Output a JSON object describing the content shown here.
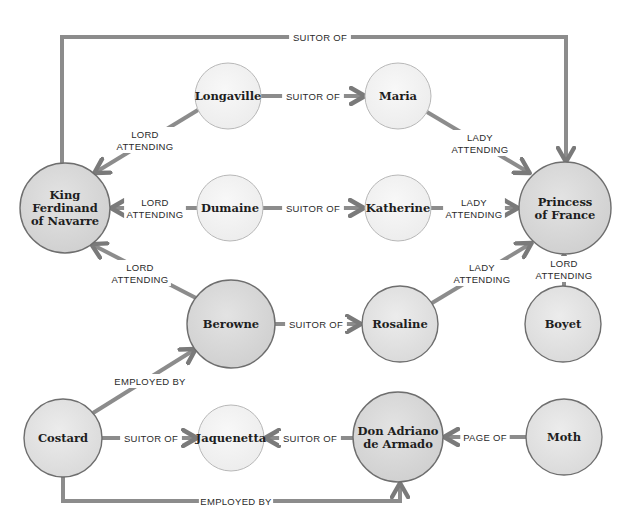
{
  "diagram": {
    "type": "character relationship graph",
    "nodes": [
      {
        "id": "king",
        "label_lines": [
          "King",
          "Ferdinand",
          "of Navarre"
        ],
        "cx": 65,
        "cy": 208,
        "r": 45,
        "shade": "dark"
      },
      {
        "id": "longaville",
        "label_lines": [
          "Longaville"
        ],
        "cx": 228,
        "cy": 96,
        "r": 33,
        "shade": "light"
      },
      {
        "id": "maria",
        "label_lines": [
          "Maria"
        ],
        "cx": 398,
        "cy": 96,
        "r": 33,
        "shade": "light"
      },
      {
        "id": "dumaine",
        "label_lines": [
          "Dumaine"
        ],
        "cx": 230,
        "cy": 208,
        "r": 33,
        "shade": "light"
      },
      {
        "id": "katherine",
        "label_lines": [
          "Katherine"
        ],
        "cx": 398,
        "cy": 208,
        "r": 33,
        "shade": "light"
      },
      {
        "id": "princess",
        "label_lines": [
          "Princess",
          "of France"
        ],
        "cx": 565,
        "cy": 208,
        "r": 46,
        "shade": "dark"
      },
      {
        "id": "berowne",
        "label_lines": [
          "Berowne"
        ],
        "cx": 231,
        "cy": 324,
        "r": 44,
        "shade": "dark"
      },
      {
        "id": "rosaline",
        "label_lines": [
          "Rosaline"
        ],
        "cx": 400,
        "cy": 324,
        "r": 38,
        "shade": "mid"
      },
      {
        "id": "boyet",
        "label_lines": [
          "Boyet"
        ],
        "cx": 563,
        "cy": 324,
        "r": 38,
        "shade": "mid"
      },
      {
        "id": "costard",
        "label_lines": [
          "Costard"
        ],
        "cx": 63,
        "cy": 438,
        "r": 39,
        "shade": "mid"
      },
      {
        "id": "jaquenetta",
        "label_lines": [
          "Jaquenetta"
        ],
        "cx": 231,
        "cy": 438,
        "r": 33,
        "shade": "light"
      },
      {
        "id": "armado",
        "label_lines": [
          "Don Adriano",
          "de Armado"
        ],
        "cx": 398,
        "cy": 437,
        "r": 45,
        "shade": "dark"
      },
      {
        "id": "moth",
        "label_lines": [
          "Moth"
        ],
        "cx": 564,
        "cy": 437,
        "r": 38,
        "shade": "mid"
      }
    ],
    "edges": [
      {
        "from": "king",
        "to": "princess",
        "label_lines": [
          "SUITOR OF"
        ],
        "path": "M62,163 L62,37 L566,37 L566,160",
        "label_x": 320,
        "label_y": 37
      },
      {
        "from": "longaville",
        "to": "maria",
        "label_lines": [
          "SUITOR OF"
        ],
        "path": "M261,96 L363,96",
        "label_x": 313,
        "label_y": 96
      },
      {
        "from": "longaville",
        "to": "king",
        "label_lines": [
          "LORD",
          "ATTENDING"
        ],
        "path": "M198,110 L96,172",
        "label_x": 145,
        "label_y": 140
      },
      {
        "from": "maria",
        "to": "princess",
        "label_lines": [
          "LADY",
          "ATTENDING"
        ],
        "path": "M427,112 L528,172",
        "label_x": 480,
        "label_y": 143
      },
      {
        "from": "dumaine",
        "to": "king",
        "label_lines": [
          "LORD",
          "ATTENDING"
        ],
        "path": "M197,208 L113,208",
        "label_x": 155,
        "label_y": 208
      },
      {
        "from": "dumaine",
        "to": "katherine",
        "label_lines": [
          "SUITOR OF"
        ],
        "path": "M263,208 L362,208",
        "label_x": 313,
        "label_y": 208
      },
      {
        "from": "katherine",
        "to": "princess",
        "label_lines": [
          "LADY",
          "ATTENDING"
        ],
        "path": "M431,208 L516,208",
        "label_x": 474,
        "label_y": 208
      },
      {
        "from": "berowne",
        "to": "king",
        "label_lines": [
          "LORD",
          "ATTENDING"
        ],
        "path": "M196,298 L93,245",
        "label_x": 140,
        "label_y": 273
      },
      {
        "from": "berowne",
        "to": "rosaline",
        "label_lines": [
          "SUITOR OF"
        ],
        "path": "M275,324 L359,324",
        "label_x": 316,
        "label_y": 324
      },
      {
        "from": "rosaline",
        "to": "princess",
        "label_lines": [
          "LADY",
          "ATTENDING"
        ],
        "path": "M432,303 L530,244",
        "label_x": 482,
        "label_y": 273
      },
      {
        "from": "boyet",
        "to": "princess",
        "label_lines": [
          "LORD",
          "ATTENDING"
        ],
        "path": "M564,286 L564,257",
        "label_x": 564,
        "label_y": 269
      },
      {
        "from": "costard",
        "to": "berowne",
        "label_lines": [
          "EMPLOYED BY"
        ],
        "path": "M93,413 L194,350",
        "label_x": 150,
        "label_y": 381
      },
      {
        "from": "costard",
        "to": "jaquenetta",
        "label_lines": [
          "SUITOR OF"
        ],
        "path": "M102,438 L195,438",
        "label_x": 151,
        "label_y": 438
      },
      {
        "from": "armado",
        "to": "jaquenetta",
        "label_lines": [
          "SUITOR OF"
        ],
        "path": "M353,438 L267,438",
        "label_x": 310,
        "label_y": 438
      },
      {
        "from": "moth",
        "to": "armado",
        "label_lines": [
          "PAGE OF"
        ],
        "path": "M526,437 L446,437",
        "label_x": 485,
        "label_y": 437
      },
      {
        "from": "costard",
        "to": "armado",
        "label_lines": [
          "EMPLOYED BY"
        ],
        "path": "M63,477 L63,501 L400,501 L400,485",
        "label_x": 236,
        "label_y": 501
      }
    ],
    "colors": {
      "background": "#ffffff",
      "node_dark_fill": "#d9d9d9",
      "node_mid_fill": "#e2e2e2",
      "node_light_fill": "#f1f1f1",
      "node_dark_stroke": "#6e6e6e",
      "node_light_stroke": "#b8b8b8",
      "edge_stroke": "#8c8c8c",
      "edge_dark": "#6f6f6f",
      "label_text": "#1e1e1e"
    }
  }
}
